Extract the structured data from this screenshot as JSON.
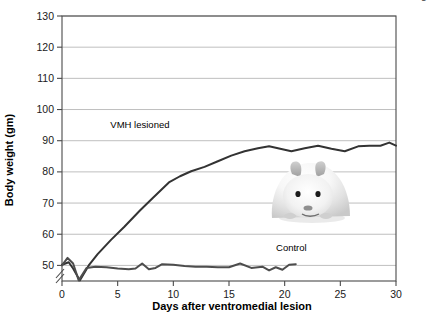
{
  "chart_data": {
    "type": "line",
    "title": "",
    "xlabel": "Days after ventromedial lesion",
    "ylabel": "Body weight (gm)",
    "xlim": [
      0,
      30
    ],
    "ylim": [
      45,
      130
    ],
    "y_axis_break": true,
    "y_break_note": "axis broken below 50",
    "grid": true,
    "grid_orientation": "horizontal",
    "legend_position": "inline-labels",
    "xticks": [
      0,
      5,
      10,
      15,
      20,
      25,
      30
    ],
    "yticks": [
      50,
      60,
      70,
      80,
      90,
      100,
      110,
      120,
      130
    ],
    "series": [
      {
        "name": "VMH lesioned",
        "color": "#333333",
        "x": [
          0,
          0.6,
          1.0,
          1.6,
          2.4,
          3.2,
          4.4,
          5.6,
          7.0,
          8.2,
          9.6,
          10.6,
          11.6,
          12.8,
          14.0,
          15.2,
          16.4,
          17.6,
          18.6,
          19.6,
          20.6,
          21.8,
          23.0,
          24.2,
          25.4,
          26.6,
          27.6,
          28.6,
          29.4,
          30.0
        ],
        "y": [
          50.2,
          51.0,
          49.0,
          45.2,
          50.0,
          53.6,
          58.2,
          62.4,
          67.6,
          71.8,
          76.6,
          78.6,
          80.2,
          81.6,
          83.4,
          85.2,
          86.6,
          87.6,
          88.2,
          87.4,
          86.6,
          87.6,
          88.4,
          87.4,
          86.6,
          88.2,
          88.4,
          88.4,
          89.4,
          88.4
        ]
      },
      {
        "name": "Control",
        "color": "#4d4d4d",
        "x": [
          0,
          0.5,
          1.0,
          1.5,
          2.2,
          3.0,
          4.0,
          5.0,
          6.0,
          6.6,
          7.2,
          7.8,
          8.4,
          9.0,
          10.0,
          11.0,
          12.0,
          13.0,
          14.0,
          15.0,
          16.0,
          17.0,
          18.0,
          18.6,
          19.2,
          19.8,
          20.4,
          21.0
        ],
        "y": [
          50.0,
          52.4,
          50.6,
          45.2,
          49.2,
          49.6,
          49.4,
          49.0,
          48.8,
          49.0,
          50.6,
          48.8,
          49.2,
          50.4,
          50.2,
          49.8,
          49.6,
          49.6,
          49.4,
          49.4,
          50.6,
          49.2,
          49.6,
          48.4,
          49.4,
          48.6,
          50.2,
          50.4
        ]
      }
    ],
    "series_labels": [
      {
        "text": "VMH lesioned",
        "x": 7.0,
        "y": 94.0
      },
      {
        "text": "Control",
        "x": 20.6,
        "y": 54.5
      }
    ],
    "annotations": [
      {
        "name": "hamster-photo",
        "description": "photograph of an obese white hamster"
      }
    ]
  },
  "credit": {
    "line1": "Illustration: © Cengage Learning 2013;",
    "line2": "photo: © Dr. Paul Kenyon, University of Plymouth"
  },
  "colors": {
    "plot_border": "#4a4a4a",
    "grid": "#b8b8b8",
    "background": "#ffffff",
    "text": "#000000"
  }
}
